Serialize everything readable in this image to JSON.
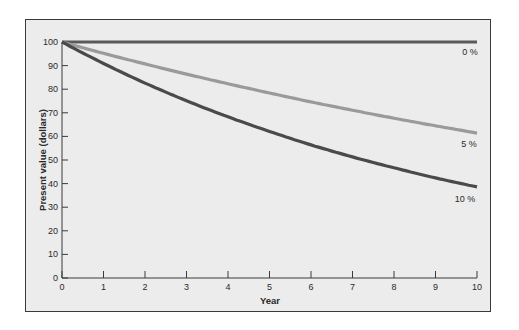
{
  "chart_data": {
    "type": "line",
    "title": "",
    "xlabel": "Year",
    "ylabel": "Present value (dollars)",
    "xlim": [
      0,
      10
    ],
    "ylim": [
      0,
      100
    ],
    "x_ticks": [
      0,
      1,
      2,
      3,
      4,
      5,
      6,
      7,
      8,
      9,
      10
    ],
    "y_ticks": [
      0,
      10,
      20,
      30,
      40,
      50,
      60,
      70,
      80,
      90,
      100
    ],
    "grid": false,
    "legend": "inline labels at right end of each line",
    "x": [
      0,
      1,
      2,
      3,
      4,
      5,
      6,
      7,
      8,
      9,
      10
    ],
    "series": [
      {
        "name": "0 %",
        "label": "0 %",
        "color": "#5a5a5a",
        "values": [
          100,
          100,
          100,
          100,
          100,
          100,
          100,
          100,
          100,
          100,
          100
        ]
      },
      {
        "name": "5 %",
        "label": "5 %",
        "color": "#9a9a9a",
        "values": [
          100,
          95.2,
          90.7,
          86.4,
          82.3,
          78.4,
          74.6,
          71.1,
          67.7,
          64.5,
          61.4
        ]
      },
      {
        "name": "10 %",
        "label": "10 %",
        "color": "#4a4a4a",
        "values": [
          100,
          90.9,
          82.6,
          75.1,
          68.3,
          62.1,
          56.4,
          51.3,
          46.7,
          42.4,
          38.6
        ]
      }
    ]
  }
}
